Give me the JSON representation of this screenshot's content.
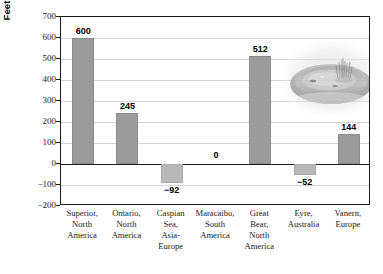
{
  "chart_data": {
    "type": "bar",
    "title": "",
    "xlabel": "",
    "ylabel": "Feet Above or Below Sea Level",
    "ylim": [
      -200,
      700
    ],
    "ytick_step": 100,
    "yticks": [
      700,
      600,
      500,
      400,
      300,
      200,
      100,
      0,
      -100,
      -200
    ],
    "ytick_labels": [
      "700",
      "600",
      "500",
      "400",
      "300",
      "200",
      "100",
      "0",
      "−100",
      "−200"
    ],
    "grid": true,
    "legend": "none",
    "categories": [
      "Superior, North America",
      "Ontario, North America",
      "Caspian Sea, Asia-Europe",
      "Maracaibo, South America",
      "Great Bear, North America",
      "Eyre, Australia",
      "Vanern, Europe"
    ],
    "category_lines": [
      [
        "Superior,",
        "North",
        "America"
      ],
      [
        "Ontario,",
        "North",
        "America"
      ],
      [
        "Caspian",
        "Sea,",
        "Asia-",
        "Europe"
      ],
      [
        "Maracaibo,",
        "South",
        "America"
      ],
      [
        "Great",
        "Bear,",
        "North",
        "America"
      ],
      [
        "Eyre,",
        "Australia"
      ],
      [
        "Vanern,",
        "Europe"
      ]
    ],
    "values": [
      600,
      245,
      -92,
      0,
      512,
      -52,
      144
    ],
    "value_labels": [
      "600",
      "245",
      "−92",
      "0",
      "512",
      "−52",
      "144"
    ],
    "colors": {
      "bar_positive": "#9b9b9b",
      "bar_negative": "#b9b9b9",
      "gridline": "#d2d2d2",
      "axis": "#1b1b1b",
      "text": "#000000",
      "background": "#ffffff"
    }
  },
  "inset": {
    "name": "lake-landform-photo",
    "description": "Faded grayscale photo of a lake basin landform"
  }
}
